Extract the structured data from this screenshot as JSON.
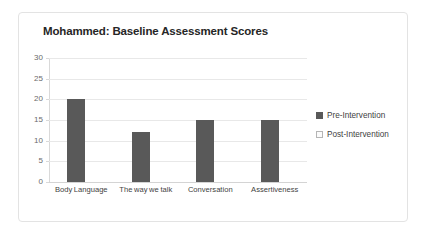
{
  "chart_data": {
    "type": "bar",
    "title": "Mohammed: Baseline Assessment Scores",
    "xlabel": "",
    "ylabel": "",
    "ylim": [
      0,
      30
    ],
    "yticks": [
      0,
      5,
      10,
      15,
      20,
      25,
      30
    ],
    "ytick_labels": [
      "0",
      "5",
      "10",
      "15",
      "20",
      "25",
      "30"
    ],
    "grid": true,
    "legend_position": "right",
    "categories": [
      "Body Language",
      "The way we talk",
      "Conversation",
      "Assertiveness"
    ],
    "series": [
      {
        "name": "Pre-Intervention",
        "color": "#595959",
        "values": [
          20,
          12,
          15,
          15
        ]
      },
      {
        "name": "Post-Intervention",
        "color": "#fbfbfb",
        "values": [
          null,
          null,
          null,
          null
        ]
      }
    ]
  },
  "legend": {
    "entries": [
      {
        "label": "Pre-Intervention",
        "swatch": "filled-dark-square-icon"
      },
      {
        "label": "Post-Intervention",
        "swatch": "outlined-light-square-icon"
      }
    ]
  }
}
